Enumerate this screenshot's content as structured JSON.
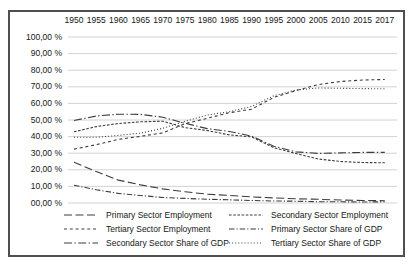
{
  "chart_data": {
    "type": "line",
    "title": "",
    "xlabel": "",
    "ylabel": "",
    "grid": "horizontal",
    "legend_position": "bottom",
    "line_color": "#3c3c3c",
    "grid_color": "#c6c6c6",
    "frame_color": "#4f4f4f",
    "x_categories": [
      "1950",
      "1955",
      "1960",
      "1965",
      "1970",
      "1975",
      "1980",
      "1985",
      "1990",
      "1995",
      "2000",
      "2005",
      "2010",
      "2015",
      "2017"
    ],
    "y_axis": {
      "min": 0,
      "max": 100,
      "step": 10,
      "unit": "%",
      "tick_labels": [
        "100,00 %",
        "90,00 %",
        "80,00 %",
        "70,00 %",
        "60,00 %",
        "50,00 %",
        "40,00 %",
        "30,00 %",
        "20,00 %",
        "10,00 %",
        "00,00 %"
      ]
    },
    "series": [
      {
        "name": "Primary Sector Employment",
        "style": "long-dash",
        "dash": "8,3.5",
        "values": [
          24.6,
          18.9,
          13.8,
          10.9,
          8.5,
          6.8,
          5.3,
          4.6,
          3.7,
          3.1,
          2.5,
          2.2,
          1.8,
          1.5,
          1.4
        ]
      },
      {
        "name": "Secondary Sector Employment",
        "style": "fine-dash",
        "dash": "2.6,1.6",
        "values": [
          42.9,
          46.0,
          47.9,
          48.9,
          49.3,
          45.4,
          43.7,
          41.0,
          39.8,
          33.3,
          29.8,
          26.5,
          25.0,
          24.4,
          24.2
        ]
      },
      {
        "name": "Tertiary Sector Employment",
        "style": "short-dash",
        "dash": "3,2.8",
        "values": [
          32.5,
          35.1,
          38.3,
          40.2,
          42.2,
          47.8,
          51.0,
          54.4,
          56.5,
          63.6,
          67.7,
          71.3,
          73.2,
          74.1,
          74.4
        ]
      },
      {
        "name": "Primary Sector Share of GDP",
        "style": "dash-dot",
        "dash": "5.5,2,1.2,2",
        "values": [
          10.7,
          8.0,
          5.8,
          4.5,
          3.3,
          2.8,
          2.2,
          1.9,
          1.5,
          1.2,
          1.1,
          0.8,
          0.7,
          0.6,
          0.7
        ]
      },
      {
        "name": "Secondary Sector Share of GDP",
        "style": "dash-dot",
        "dash": "8,2.4,1.4,2.4",
        "values": [
          49.7,
          52.4,
          53.5,
          53.4,
          51.7,
          48.0,
          44.8,
          43.1,
          40.3,
          34.2,
          30.8,
          29.9,
          30.2,
          30.5,
          30.5
        ]
      },
      {
        "name": "Tertiary Sector Share of GDP",
        "style": "dots",
        "dash": "1,2.1",
        "values": [
          39.6,
          39.6,
          40.7,
          42.1,
          45.0,
          49.2,
          53.0,
          55.0,
          58.2,
          64.6,
          68.1,
          69.3,
          69.1,
          68.9,
          68.8
        ]
      }
    ],
    "layout": {
      "plot_left": 58,
      "plot_right": 387,
      "y_top": 25,
      "y_bottom": 191,
      "x_first_tick": 64,
      "x_tick_spacing": 22.2
    }
  }
}
